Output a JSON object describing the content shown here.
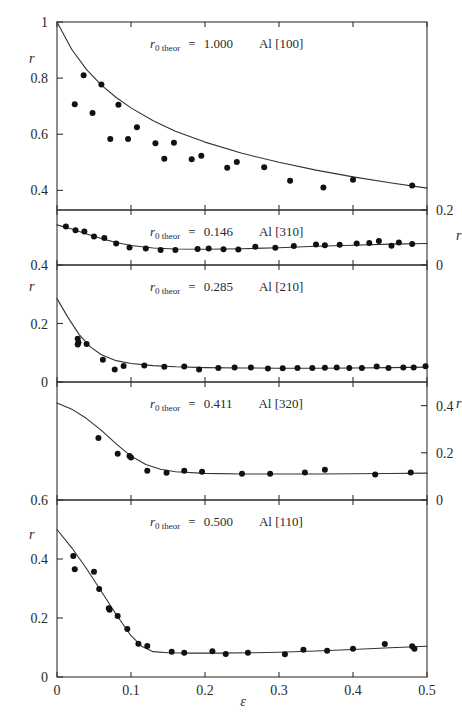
{
  "figure": {
    "xlabel": "ε",
    "ylabel": "r",
    "x_ticks": [
      "0",
      "0.1",
      "0.2",
      "0.3",
      "0.4",
      "0.5"
    ],
    "x_tick_values": [
      0,
      0.1,
      0.2,
      0.3,
      0.4,
      0.5
    ],
    "xlim": [
      0,
      0.5
    ],
    "label_prefix": "r",
    "label_subscript": "0 theor",
    "label_equals": "="
  },
  "chart_data": [
    {
      "type": "scatter",
      "panel_index": 0,
      "title": "Al [100]",
      "r0_theor": "1.000",
      "material": "Al",
      "orientation": "[100]",
      "xlabel": "ε",
      "ylabel": "r",
      "ylabel_side": "left",
      "ylim": [
        0.33,
        1.0
      ],
      "y_ticks": [
        "1",
        "0.8",
        "0.6",
        "0.4"
      ],
      "y_tick_values": [
        1.0,
        0.8,
        0.6,
        0.4
      ],
      "grid": false,
      "legend": "none",
      "points": [
        {
          "x": 0.024,
          "y": 0.707
        },
        {
          "x": 0.036,
          "y": 0.81
        },
        {
          "x": 0.048,
          "y": 0.676
        },
        {
          "x": 0.06,
          "y": 0.777
        },
        {
          "x": 0.072,
          "y": 0.583
        },
        {
          "x": 0.083,
          "y": 0.705
        },
        {
          "x": 0.096,
          "y": 0.583
        },
        {
          "x": 0.108,
          "y": 0.625
        },
        {
          "x": 0.133,
          "y": 0.568
        },
        {
          "x": 0.145,
          "y": 0.513
        },
        {
          "x": 0.158,
          "y": 0.57
        },
        {
          "x": 0.182,
          "y": 0.511
        },
        {
          "x": 0.195,
          "y": 0.523
        },
        {
          "x": 0.23,
          "y": 0.481
        },
        {
          "x": 0.243,
          "y": 0.501
        },
        {
          "x": 0.28,
          "y": 0.482
        },
        {
          "x": 0.315,
          "y": 0.434
        },
        {
          "x": 0.36,
          "y": 0.41
        },
        {
          "x": 0.4,
          "y": 0.438
        },
        {
          "x": 0.48,
          "y": 0.417
        }
      ],
      "curve": [
        {
          "x": 0.0,
          "y": 1.0
        },
        {
          "x": 0.02,
          "y": 0.902
        },
        {
          "x": 0.04,
          "y": 0.83
        },
        {
          "x": 0.06,
          "y": 0.775
        },
        {
          "x": 0.08,
          "y": 0.731
        },
        {
          "x": 0.1,
          "y": 0.694
        },
        {
          "x": 0.13,
          "y": 0.648
        },
        {
          "x": 0.16,
          "y": 0.611
        },
        {
          "x": 0.2,
          "y": 0.572
        },
        {
          "x": 0.25,
          "y": 0.532
        },
        {
          "x": 0.3,
          "y": 0.5
        },
        {
          "x": 0.35,
          "y": 0.472
        },
        {
          "x": 0.4,
          "y": 0.448
        },
        {
          "x": 0.45,
          "y": 0.427
        },
        {
          "x": 0.5,
          "y": 0.408
        }
      ]
    },
    {
      "type": "scatter",
      "panel_index": 1,
      "title": "Al [310]",
      "r0_theor": "0.146",
      "material": "Al",
      "orientation": "[310]",
      "xlabel": "ε",
      "ylabel": "r",
      "ylabel_side": "right",
      "ylim": [
        0.0,
        0.2
      ],
      "y_ticks": [
        "0.2",
        "0"
      ],
      "y_tick_values": [
        0.2,
        0.0
      ],
      "grid": false,
      "legend": "none",
      "points": [
        {
          "x": 0.012,
          "y": 0.14
        },
        {
          "x": 0.025,
          "y": 0.126
        },
        {
          "x": 0.037,
          "y": 0.122
        },
        {
          "x": 0.05,
          "y": 0.104
        },
        {
          "x": 0.064,
          "y": 0.098
        },
        {
          "x": 0.08,
          "y": 0.078
        },
        {
          "x": 0.098,
          "y": 0.064
        },
        {
          "x": 0.12,
          "y": 0.06
        },
        {
          "x": 0.14,
          "y": 0.055
        },
        {
          "x": 0.16,
          "y": 0.055
        },
        {
          "x": 0.19,
          "y": 0.058
        },
        {
          "x": 0.205,
          "y": 0.06
        },
        {
          "x": 0.225,
          "y": 0.057
        },
        {
          "x": 0.245,
          "y": 0.056
        },
        {
          "x": 0.268,
          "y": 0.066
        },
        {
          "x": 0.295,
          "y": 0.063
        },
        {
          "x": 0.32,
          "y": 0.069
        },
        {
          "x": 0.35,
          "y": 0.075
        },
        {
          "x": 0.362,
          "y": 0.072
        },
        {
          "x": 0.382,
          "y": 0.074
        },
        {
          "x": 0.405,
          "y": 0.078
        },
        {
          "x": 0.422,
          "y": 0.08
        },
        {
          "x": 0.435,
          "y": 0.087
        },
        {
          "x": 0.452,
          "y": 0.07
        },
        {
          "x": 0.462,
          "y": 0.082
        },
        {
          "x": 0.48,
          "y": 0.076
        }
      ],
      "curve": [
        {
          "x": 0.0,
          "y": 0.146
        },
        {
          "x": 0.02,
          "y": 0.131
        },
        {
          "x": 0.04,
          "y": 0.113
        },
        {
          "x": 0.06,
          "y": 0.096
        },
        {
          "x": 0.08,
          "y": 0.082
        },
        {
          "x": 0.1,
          "y": 0.071
        },
        {
          "x": 0.13,
          "y": 0.062
        },
        {
          "x": 0.16,
          "y": 0.058
        },
        {
          "x": 0.2,
          "y": 0.057
        },
        {
          "x": 0.25,
          "y": 0.059
        },
        {
          "x": 0.3,
          "y": 0.063
        },
        {
          "x": 0.35,
          "y": 0.068
        },
        {
          "x": 0.4,
          "y": 0.072
        },
        {
          "x": 0.45,
          "y": 0.076
        },
        {
          "x": 0.5,
          "y": 0.078
        }
      ]
    },
    {
      "type": "scatter",
      "panel_index": 2,
      "title": "Al [210]",
      "r0_theor": "0.285",
      "material": "Al",
      "orientation": "[210]",
      "xlabel": "ε",
      "ylabel": "r",
      "ylabel_side": "left",
      "ylim": [
        0.0,
        0.4
      ],
      "y_ticks": [
        "0.4",
        "0.2",
        "0"
      ],
      "y_tick_values": [
        0.4,
        0.2,
        0.0
      ],
      "grid": false,
      "legend": "none",
      "points": [
        {
          "x": 0.028,
          "y": 0.148
        },
        {
          "x": 0.028,
          "y": 0.128
        },
        {
          "x": 0.029,
          "y": 0.135
        },
        {
          "x": 0.04,
          "y": 0.13
        },
        {
          "x": 0.062,
          "y": 0.076
        },
        {
          "x": 0.078,
          "y": 0.043
        },
        {
          "x": 0.09,
          "y": 0.055
        },
        {
          "x": 0.118,
          "y": 0.056
        },
        {
          "x": 0.145,
          "y": 0.052
        },
        {
          "x": 0.172,
          "y": 0.053
        },
        {
          "x": 0.192,
          "y": 0.043
        },
        {
          "x": 0.218,
          "y": 0.048
        },
        {
          "x": 0.24,
          "y": 0.05
        },
        {
          "x": 0.262,
          "y": 0.05
        },
        {
          "x": 0.285,
          "y": 0.046
        },
        {
          "x": 0.305,
          "y": 0.047
        },
        {
          "x": 0.325,
          "y": 0.048
        },
        {
          "x": 0.345,
          "y": 0.048
        },
        {
          "x": 0.362,
          "y": 0.049
        },
        {
          "x": 0.378,
          "y": 0.05
        },
        {
          "x": 0.395,
          "y": 0.048
        },
        {
          "x": 0.412,
          "y": 0.048
        },
        {
          "x": 0.432,
          "y": 0.053
        },
        {
          "x": 0.448,
          "y": 0.048
        },
        {
          "x": 0.468,
          "y": 0.05
        },
        {
          "x": 0.482,
          "y": 0.05
        },
        {
          "x": 0.498,
          "y": 0.054
        }
      ],
      "curve": [
        {
          "x": 0.0,
          "y": 0.285
        },
        {
          "x": 0.015,
          "y": 0.22
        },
        {
          "x": 0.03,
          "y": 0.162
        },
        {
          "x": 0.045,
          "y": 0.12
        },
        {
          "x": 0.06,
          "y": 0.093
        },
        {
          "x": 0.08,
          "y": 0.073
        },
        {
          "x": 0.1,
          "y": 0.063
        },
        {
          "x": 0.13,
          "y": 0.056
        },
        {
          "x": 0.16,
          "y": 0.052
        },
        {
          "x": 0.2,
          "y": 0.049
        },
        {
          "x": 0.25,
          "y": 0.048
        },
        {
          "x": 0.3,
          "y": 0.047
        },
        {
          "x": 0.35,
          "y": 0.047
        },
        {
          "x": 0.4,
          "y": 0.048
        },
        {
          "x": 0.45,
          "y": 0.049
        },
        {
          "x": 0.5,
          "y": 0.051
        }
      ]
    },
    {
      "type": "scatter",
      "panel_index": 3,
      "title": "Al [320]",
      "r0_theor": "0.411",
      "material": "Al",
      "orientation": "[320]",
      "xlabel": "ε",
      "ylabel": "r",
      "ylabel_side": "right",
      "ylim": [
        0.0,
        0.5
      ],
      "y_ticks": [
        "0.4",
        "0.2",
        "0"
      ],
      "y_tick_values": [
        0.4,
        0.2,
        0.0
      ],
      "grid": false,
      "legend": "none",
      "points": [
        {
          "x": 0.056,
          "y": 0.263
        },
        {
          "x": 0.082,
          "y": 0.196
        },
        {
          "x": 0.098,
          "y": 0.186
        },
        {
          "x": 0.1,
          "y": 0.18
        },
        {
          "x": 0.122,
          "y": 0.124
        },
        {
          "x": 0.148,
          "y": 0.115
        },
        {
          "x": 0.172,
          "y": 0.124
        },
        {
          "x": 0.196,
          "y": 0.12
        },
        {
          "x": 0.25,
          "y": 0.111
        },
        {
          "x": 0.288,
          "y": 0.111
        },
        {
          "x": 0.335,
          "y": 0.116
        },
        {
          "x": 0.362,
          "y": 0.128
        },
        {
          "x": 0.43,
          "y": 0.108
        },
        {
          "x": 0.478,
          "y": 0.116
        }
      ],
      "curve": [
        {
          "x": 0.0,
          "y": 0.411
        },
        {
          "x": 0.02,
          "y": 0.385
        },
        {
          "x": 0.04,
          "y": 0.345
        },
        {
          "x": 0.06,
          "y": 0.295
        },
        {
          "x": 0.08,
          "y": 0.238
        },
        {
          "x": 0.1,
          "y": 0.186
        },
        {
          "x": 0.12,
          "y": 0.15
        },
        {
          "x": 0.14,
          "y": 0.13
        },
        {
          "x": 0.16,
          "y": 0.12
        },
        {
          "x": 0.2,
          "y": 0.113
        },
        {
          "x": 0.25,
          "y": 0.11
        },
        {
          "x": 0.3,
          "y": 0.11
        },
        {
          "x": 0.35,
          "y": 0.11
        },
        {
          "x": 0.4,
          "y": 0.111
        },
        {
          "x": 0.45,
          "y": 0.112
        },
        {
          "x": 0.5,
          "y": 0.114
        }
      ]
    },
    {
      "type": "scatter",
      "panel_index": 4,
      "title": "Al [110]",
      "r0_theor": "0.500",
      "material": "Al",
      "orientation": "[110]",
      "xlabel": "ε",
      "ylabel": "r",
      "ylabel_side": "left",
      "ylim": [
        0.0,
        0.6
      ],
      "y_ticks": [
        "0.6",
        "0.4",
        "0.2",
        "0"
      ],
      "y_tick_values": [
        0.6,
        0.4,
        0.2,
        0.0
      ],
      "grid": false,
      "legend": "none",
      "points": [
        {
          "x": 0.022,
          "y": 0.41
        },
        {
          "x": 0.024,
          "y": 0.365
        },
        {
          "x": 0.05,
          "y": 0.357
        },
        {
          "x": 0.057,
          "y": 0.298
        },
        {
          "x": 0.07,
          "y": 0.233
        },
        {
          "x": 0.071,
          "y": 0.228
        },
        {
          "x": 0.082,
          "y": 0.207
        },
        {
          "x": 0.095,
          "y": 0.163
        },
        {
          "x": 0.11,
          "y": 0.113
        },
        {
          "x": 0.122,
          "y": 0.105
        },
        {
          "x": 0.155,
          "y": 0.086
        },
        {
          "x": 0.172,
          "y": 0.082
        },
        {
          "x": 0.21,
          "y": 0.087
        },
        {
          "x": 0.228,
          "y": 0.078
        },
        {
          "x": 0.258,
          "y": 0.082
        },
        {
          "x": 0.308,
          "y": 0.077
        },
        {
          "x": 0.333,
          "y": 0.092
        },
        {
          "x": 0.365,
          "y": 0.089
        },
        {
          "x": 0.4,
          "y": 0.096
        },
        {
          "x": 0.443,
          "y": 0.112
        },
        {
          "x": 0.48,
          "y": 0.104
        },
        {
          "x": 0.483,
          "y": 0.096
        }
      ],
      "curve": [
        {
          "x": 0.0,
          "y": 0.5
        },
        {
          "x": 0.02,
          "y": 0.438
        },
        {
          "x": 0.04,
          "y": 0.367
        },
        {
          "x": 0.06,
          "y": 0.29
        },
        {
          "x": 0.08,
          "y": 0.212
        },
        {
          "x": 0.1,
          "y": 0.14
        },
        {
          "x": 0.115,
          "y": 0.103
        },
        {
          "x": 0.13,
          "y": 0.086
        },
        {
          "x": 0.15,
          "y": 0.082
        },
        {
          "x": 0.18,
          "y": 0.081
        },
        {
          "x": 0.22,
          "y": 0.081
        },
        {
          "x": 0.26,
          "y": 0.082
        },
        {
          "x": 0.3,
          "y": 0.084
        },
        {
          "x": 0.35,
          "y": 0.088
        },
        {
          "x": 0.4,
          "y": 0.093
        },
        {
          "x": 0.45,
          "y": 0.099
        },
        {
          "x": 0.5,
          "y": 0.104
        }
      ]
    }
  ]
}
